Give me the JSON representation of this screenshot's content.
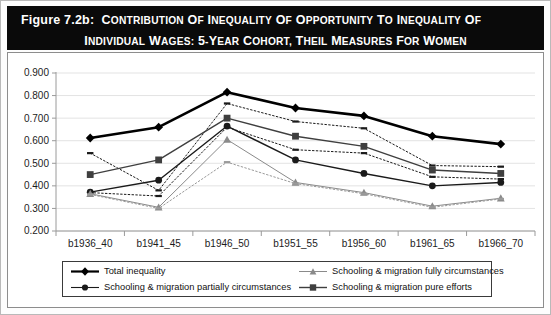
{
  "figure": {
    "label": "Figure 7.2b:",
    "title_line1": "Contribution of Inequality of Opportunity to Inequality of",
    "title_line2": "Individual Wages: 5-year Cohort, Theil Measures for Women"
  },
  "colors": {
    "title_bg": "#0a0a0a",
    "title_fg": "#ffffff",
    "panel_border": "#8d8d8d",
    "grid": "#e3e3e3",
    "series_dark": "#000000",
    "series_mid": "#3f3f3f",
    "series_gray": "#8a8a8a"
  },
  "legend": {
    "items": [
      {
        "label": "Total inequality",
        "marker": "diamond",
        "style": "solid",
        "weight": "thick",
        "color": "#000000"
      },
      {
        "label": "Schooling & migration partially circumstances",
        "marker": "circle",
        "style": "solid",
        "weight": "medium",
        "color": "#1a1a1a"
      },
      {
        "label": "Schooling & migration fully circumstances",
        "marker": "triangle",
        "style": "solid",
        "weight": "thin",
        "color": "#8a8a8a"
      },
      {
        "label": "Schooling & migration pure efforts",
        "marker": "square",
        "style": "solid",
        "weight": "medium",
        "color": "#3f3f3f"
      }
    ]
  },
  "chart_data": {
    "type": "line",
    "xlabel": "",
    "ylabel": "",
    "ylim": [
      0.2,
      0.9
    ],
    "ytick_step": 0.1,
    "ytick_labels": [
      "0.900",
      "0.800",
      "0.700",
      "0.600",
      "0.500",
      "0.400",
      "0.300",
      "0.200"
    ],
    "grid": true,
    "legend_position": "bottom",
    "categories": [
      "b1936_40",
      "b1941_45",
      "b1946_50",
      "b1951_55",
      "b1956_60",
      "b1961_65",
      "b1966_70"
    ],
    "series": [
      {
        "name": "Total inequality",
        "marker": "diamond",
        "style": "solid",
        "weight": "thick",
        "color": "#000000",
        "values": [
          0.612,
          0.66,
          0.815,
          0.745,
          0.71,
          0.62,
          0.585
        ]
      },
      {
        "name": "Total inequality upper dotted",
        "marker": "dash",
        "style": "dotted",
        "weight": "thin",
        "color": "#1a1a1a",
        "values": [
          0.545,
          0.38,
          0.765,
          0.685,
          0.655,
          0.49,
          0.485
        ]
      },
      {
        "name": "Schooling & migration pure efforts",
        "marker": "square",
        "style": "solid",
        "weight": "medium",
        "color": "#3f3f3f",
        "values": [
          0.45,
          0.515,
          0.7,
          0.62,
          0.575,
          0.47,
          0.455
        ]
      },
      {
        "name": "Pure efforts dotted",
        "marker": "dash",
        "style": "dotted",
        "weight": "thin",
        "color": "#1a1a1a",
        "values": [
          0.37,
          0.355,
          0.66,
          0.56,
          0.545,
          0.44,
          0.43
        ]
      },
      {
        "name": "Schooling & migration partially circumstances",
        "marker": "circle",
        "style": "solid",
        "weight": "medium",
        "color": "#1a1a1a",
        "values": [
          0.372,
          0.425,
          0.665,
          0.515,
          0.455,
          0.4,
          0.415
        ]
      },
      {
        "name": "Schooling & migration fully circumstances",
        "marker": "triangle",
        "style": "solid",
        "weight": "thin",
        "color": "#8a8a8a",
        "values": [
          0.365,
          0.305,
          0.605,
          0.415,
          0.37,
          0.31,
          0.345
        ]
      },
      {
        "name": "Fully circumstances dotted",
        "marker": "dash",
        "style": "dotted",
        "weight": "thin",
        "color": "#9a9a9a",
        "values": [
          0.362,
          0.3,
          0.505,
          0.41,
          0.365,
          0.305,
          0.342
        ]
      }
    ]
  }
}
